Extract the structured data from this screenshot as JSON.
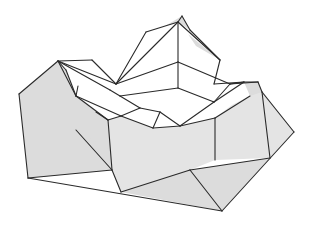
{
  "figure": {
    "colors": {
      "background": "#ffffff",
      "fold_shade": "#dcdcdc",
      "fold_shade_light": "#e4e4e4",
      "line": "#2a2a2a"
    },
    "shaded_regions": [
      {
        "name": "left-outer-flap",
        "points": "19,94 58,61 66,70 76,96 108,120 112,170 28,178"
      },
      {
        "name": "front-base",
        "points": "28,178 112,170 121,192 222,211 190,170 110,150 76,130"
      },
      {
        "name": "front-right-panel",
        "points": "112,170 108,120 121,116 153,128 180,126 215,118 215,160 190,170 121,192"
      },
      {
        "name": "right-flap",
        "points": "215,118 232,105 250,96 260,88 294,132 270,158 215,160"
      },
      {
        "name": "bottom-right-triangle",
        "points": "190,170 270,158 222,211"
      },
      {
        "name": "top-peak-cap",
        "points": "165,26 182,16 190,30 178,22"
      },
      {
        "name": "right-peak-cap",
        "points": "188,34 196,46 220,60 210,52"
      },
      {
        "name": "right-small-cap",
        "points": "244,82 258,82 262,92 250,96"
      }
    ],
    "fold_lines": [
      "19,94 58,61",
      "58,61 66,70",
      "19,94 28,178",
      "28,178 222,211",
      "222,211 294,132",
      "294,132 262,92",
      "262,92 258,82",
      "258,82 244,82",
      "244,82 230,84",
      "58,61 92,60",
      "92,60 116,84",
      "58,61 116,84",
      "58,61 110,90",
      "58,61 76,96",
      "66,70 76,96",
      "76,96 78,86",
      "76,96 108,120",
      "108,120 112,170",
      "112,170 28,178",
      "76,130 112,170",
      "112,170 121,192",
      "121,192 190,170",
      "190,170 222,211",
      "190,170 270,158",
      "215,118 215,160",
      "270,158 262,92",
      "116,84 146,32",
      "146,32 178,22",
      "116,84 178,22",
      "178,22 182,16",
      "182,16 190,30",
      "178,22 220,60",
      "190,30 220,60",
      "220,60 214,84",
      "178,22 178,62",
      "178,62 116,84",
      "178,62 230,84",
      "230,84 258,82",
      "214,84 244,82",
      "230,84 214,102",
      "178,62 178,88",
      "178,88 120,96",
      "178,88 214,102",
      "110,90 120,96",
      "120,96 140,108",
      "140,108 160,112",
      "160,112 180,126",
      "180,126 214,102",
      "214,102 244,82",
      "180,126 215,118",
      "215,118 250,96",
      "108,120 121,116",
      "121,116 140,108",
      "121,116 153,128",
      "153,128 160,112",
      "153,128 180,126",
      "76,96 121,116",
      "96,112 108,120"
    ]
  }
}
